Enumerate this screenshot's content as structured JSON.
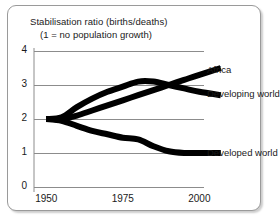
{
  "figure": {
    "title_line1": "Stabilisation ratio (births/deaths)",
    "title_line2": "(1 = no population growth)",
    "frame_color": "#9a9a9a",
    "background": "#ffffff"
  },
  "chart_data": {
    "type": "line",
    "title": "Stabilisation ratio (births/deaths)",
    "subtitle": "(1 = no population growth)",
    "xlabel": "",
    "ylabel": "",
    "xlim": [
      1946,
      2010
    ],
    "ylim": [
      0,
      4
    ],
    "xticks": [
      1950,
      1975,
      2000
    ],
    "xtick_labels": [
      "1950",
      "1975",
      "2000"
    ],
    "yticks": [
      0,
      1,
      2,
      3,
      4
    ],
    "ytick_labels": [
      "0",
      "1",
      "2",
      "3",
      "4"
    ],
    "grid": true,
    "grid_color": "#8c8c8c",
    "line_color": "#000000",
    "line_width": 6,
    "legend": "inline-right-labels",
    "series": [
      {
        "name": "Africa",
        "label": "Africa",
        "x": [
          1950,
          1955,
          1960,
          1965,
          1970,
          1975,
          1980,
          1985,
          1990,
          1995,
          2000,
          2007
        ],
        "values": [
          2.0,
          2.0,
          2.1,
          2.25,
          2.4,
          2.55,
          2.7,
          2.85,
          3.0,
          3.15,
          3.3,
          3.5
        ]
      },
      {
        "name": "Developing world",
        "label": "Developing world",
        "x": [
          1950,
          1955,
          1960,
          1965,
          1970,
          1975,
          1980,
          1985,
          1990,
          1995,
          2000,
          2007
        ],
        "values": [
          2.0,
          2.05,
          2.35,
          2.6,
          2.8,
          2.95,
          3.1,
          3.1,
          3.0,
          2.9,
          2.8,
          2.7
        ]
      },
      {
        "name": "Developed world",
        "label": "Developed world",
        "x": [
          1950,
          1955,
          1960,
          1965,
          1970,
          1975,
          1980,
          1985,
          1990,
          1995,
          2000,
          2007
        ],
        "values": [
          2.0,
          1.95,
          1.8,
          1.65,
          1.55,
          1.45,
          1.4,
          1.2,
          1.05,
          1.0,
          1.0,
          1.0
        ]
      }
    ],
    "annotations": [
      {
        "text": "Africa",
        "x": 2008,
        "y": 3.45
      },
      {
        "text": "Developing world",
        "x": 2008,
        "y": 2.75
      },
      {
        "text": "Developed world",
        "x": 2008,
        "y": 1.0
      }
    ]
  }
}
